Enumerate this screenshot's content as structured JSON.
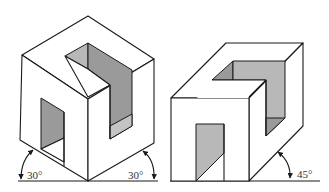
{
  "figures": [
    {
      "name": "isometric-projection",
      "angles": {
        "left": "30°",
        "right": "30°"
      }
    },
    {
      "name": "oblique-projection",
      "angles": {
        "right": "45°"
      }
    }
  ],
  "colors": {
    "line": "#1a1a1a",
    "shade_dark": "#9a9a9a",
    "shade_mid": "#b4b4b4",
    "shade_light": "#c8c8c8",
    "background": "#ffffff"
  }
}
